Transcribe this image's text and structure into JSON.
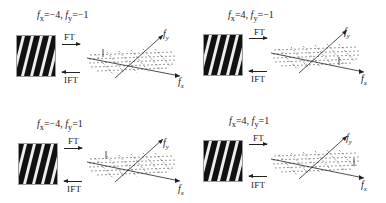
{
  "panels": [
    {
      "fx_label": "f",
      "fx_sub": "x",
      "fx_val": "=−4,",
      "fy_label": "f",
      "fy_sub": "y",
      "fy_val": "=−1",
      "ft": "FT",
      "ift": "IFT",
      "axis_x": "f",
      "axis_x_sub": "x",
      "axis_y": "f",
      "axis_y_sub": "y",
      "slope": "left",
      "spike": "back-left"
    },
    {
      "fx_label": "f",
      "fx_sub": "x",
      "fx_val": "=4,",
      "fy_label": "f",
      "fy_sub": "y",
      "fy_val": "=−1",
      "ft": "FT",
      "ift": "IFT",
      "axis_x": "f",
      "axis_x_sub": "x",
      "axis_y": "f",
      "axis_y_sub": "y",
      "slope": "right",
      "spike": "front-right"
    },
    {
      "fx_label": "f",
      "fx_sub": "x",
      "fx_val": "=−4,",
      "fy_label": "f",
      "fy_sub": "y",
      "fy_val": "=1",
      "ft": "FT",
      "ift": "IFT",
      "axis_x": "f",
      "axis_x_sub": "x",
      "axis_y": "f",
      "axis_y_sub": "y",
      "slope": "right",
      "spike": "back-left"
    },
    {
      "fx_label": "f",
      "fx_sub": "x",
      "fx_val": "=4,",
      "fy_label": "f",
      "fy_sub": "y",
      "fy_val": "=1",
      "ft": "FT",
      "ift": "IFT",
      "axis_x": "f",
      "axis_x_sub": "x",
      "axis_y": "f",
      "axis_y_sub": "y",
      "slope": "left",
      "spike": "front-right"
    }
  ]
}
